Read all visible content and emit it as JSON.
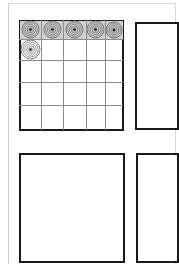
{
  "sheet": {
    "description": "Hand-drawn sketch page with four panels",
    "background": "#ffffff",
    "ink_color": "#1a1a1a",
    "grid_line_color": "#8a8a8a"
  },
  "panels": [
    {
      "id": "top-left",
      "x": 19,
      "y": 20,
      "w": 105,
      "h": 111,
      "content": "grid"
    },
    {
      "id": "top-right",
      "x": 135,
      "y": 22,
      "w": 44,
      "h": 108,
      "content": "empty"
    },
    {
      "id": "bottom-left",
      "x": 19,
      "y": 153,
      "w": 106,
      "h": 110,
      "content": "empty"
    },
    {
      "id": "bottom-right",
      "x": 136,
      "y": 153,
      "w": 43,
      "h": 110,
      "content": "empty"
    }
  ],
  "grid": {
    "columns": 5,
    "rows": 5,
    "col_lines": [
      19,
      41,
      63,
      86,
      105,
      123
    ],
    "row_lines": [
      20,
      39,
      60,
      82,
      105,
      130
    ],
    "filled_cells": [
      {
        "row": 0,
        "col": 0
      },
      {
        "row": 0,
        "col": 1
      },
      {
        "row": 0,
        "col": 2
      },
      {
        "row": 0,
        "col": 3
      },
      {
        "row": 0,
        "col": 4
      },
      {
        "row": 1,
        "col": 0
      }
    ],
    "cell_icon": "concentric-circle-spiral-icon"
  }
}
